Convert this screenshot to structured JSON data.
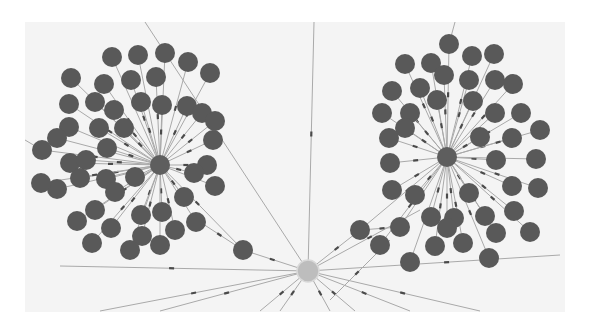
{
  "diagram": {
    "type": "graph-visualization",
    "canvas": {
      "x": 25,
      "y": 22,
      "width": 540,
      "height": 290
    },
    "colors": {
      "background": "#f4f4f4",
      "node": "#595959",
      "hub": "#5e5e5e",
      "center": "#bdbdbd",
      "edge": "#a9a9a9"
    },
    "node_radius": 10,
    "hubs": [
      {
        "id": "hub-left",
        "x": 160,
        "y": 165,
        "r": 10
      },
      {
        "id": "hub-right",
        "x": 447,
        "y": 157,
        "r": 10
      }
    ],
    "center": {
      "id": "center",
      "x": 308,
      "y": 271,
      "r": 11
    },
    "bridges": [
      {
        "id": "bridge-left",
        "x": 243,
        "y": 250,
        "r": 10
      },
      {
        "id": "bridge-right",
        "x": 360,
        "y": 230,
        "r": 10
      }
    ],
    "left_cluster": [
      [
        112,
        57
      ],
      [
        138,
        55
      ],
      [
        165,
        53
      ],
      [
        188,
        62
      ],
      [
        210,
        73
      ],
      [
        71,
        78
      ],
      [
        104,
        84
      ],
      [
        131,
        80
      ],
      [
        156,
        77
      ],
      [
        69,
        104
      ],
      [
        95,
        102
      ],
      [
        114,
        110
      ],
      [
        141,
        102
      ],
      [
        187,
        106
      ],
      [
        202,
        113
      ],
      [
        69,
        127
      ],
      [
        99,
        128
      ],
      [
        124,
        128
      ],
      [
        162,
        105
      ],
      [
        215,
        121
      ],
      [
        57,
        138
      ],
      [
        70,
        163
      ],
      [
        107,
        148
      ],
      [
        57,
        189
      ],
      [
        86,
        160
      ],
      [
        80,
        178
      ],
      [
        106,
        179
      ],
      [
        77,
        221
      ],
      [
        95,
        210
      ],
      [
        115,
        192
      ],
      [
        135,
        177
      ],
      [
        141,
        215
      ],
      [
        162,
        212
      ],
      [
        184,
        197
      ],
      [
        207,
        165
      ],
      [
        213,
        140
      ],
      [
        194,
        173
      ],
      [
        215,
        186
      ],
      [
        175,
        230
      ],
      [
        111,
        228
      ],
      [
        142,
        236
      ],
      [
        196,
        222
      ],
      [
        42,
        150
      ],
      [
        41,
        183
      ],
      [
        130,
        250
      ],
      [
        92,
        243
      ],
      [
        160,
        245
      ]
    ],
    "right_cluster": [
      [
        449,
        44
      ],
      [
        431,
        63
      ],
      [
        472,
        56
      ],
      [
        494,
        54
      ],
      [
        405,
        64
      ],
      [
        444,
        75
      ],
      [
        469,
        80
      ],
      [
        495,
        80
      ],
      [
        392,
        91
      ],
      [
        420,
        88
      ],
      [
        437,
        100
      ],
      [
        473,
        101
      ],
      [
        513,
        84
      ],
      [
        382,
        113
      ],
      [
        410,
        113
      ],
      [
        495,
        113
      ],
      [
        521,
        113
      ],
      [
        389,
        138
      ],
      [
        405,
        128
      ],
      [
        480,
        137
      ],
      [
        512,
        138
      ],
      [
        540,
        130
      ],
      [
        390,
        163
      ],
      [
        496,
        160
      ],
      [
        536,
        159
      ],
      [
        392,
        190
      ],
      [
        415,
        195
      ],
      [
        469,
        193
      ],
      [
        512,
        186
      ],
      [
        538,
        188
      ],
      [
        431,
        217
      ],
      [
        454,
        218
      ],
      [
        485,
        216
      ],
      [
        514,
        211
      ],
      [
        400,
        227
      ],
      [
        435,
        246
      ],
      [
        463,
        243
      ],
      [
        447,
        228
      ],
      [
        496,
        233
      ],
      [
        530,
        232
      ],
      [
        410,
        262
      ],
      [
        489,
        258
      ],
      [
        380,
        245
      ]
    ],
    "external_edges": [
      [
        308,
        271,
        145,
        22
      ],
      [
        308,
        271,
        314,
        22
      ],
      [
        308,
        271,
        100,
        311
      ],
      [
        308,
        271,
        160,
        311
      ],
      [
        308,
        271,
        260,
        311
      ],
      [
        308,
        271,
        280,
        311
      ],
      [
        308,
        271,
        330,
        311
      ],
      [
        308,
        271,
        355,
        311
      ],
      [
        308,
        271,
        410,
        311
      ],
      [
        308,
        271,
        480,
        311
      ],
      [
        308,
        271,
        560,
        255
      ],
      [
        308,
        271,
        243,
        250
      ],
      [
        308,
        271,
        360,
        230
      ],
      [
        308,
        271,
        60,
        266
      ],
      [
        308,
        271,
        420,
        210
      ],
      [
        243,
        250,
        200,
        222
      ],
      [
        360,
        230,
        400,
        227
      ],
      [
        42,
        150,
        25,
        140
      ],
      [
        449,
        44,
        455,
        22
      ],
      [
        390,
        240,
        330,
        300
      ]
    ]
  }
}
